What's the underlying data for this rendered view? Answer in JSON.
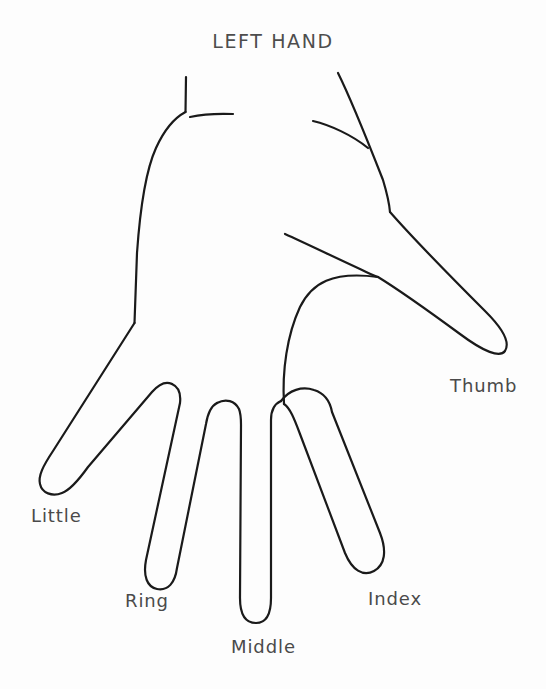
{
  "diagram": {
    "title": "LEFT HAND",
    "type": "hand-outline-diagram",
    "subject": "left hand",
    "stroke_color": "#1a1a1a",
    "background_color": "#fdfdfd",
    "text_color": "#4a4a4a",
    "stroke_width": 2.2,
    "labels": {
      "thumb": "Thumb",
      "index": "Index",
      "middle": "Middle",
      "ring": "Ring",
      "little": "Little"
    },
    "parts": [
      {
        "name": "thumb",
        "label": "Thumb"
      },
      {
        "name": "index",
        "label": "Index"
      },
      {
        "name": "middle",
        "label": "Middle"
      },
      {
        "name": "ring",
        "label": "Ring"
      },
      {
        "name": "little",
        "label": "Little"
      }
    ]
  }
}
